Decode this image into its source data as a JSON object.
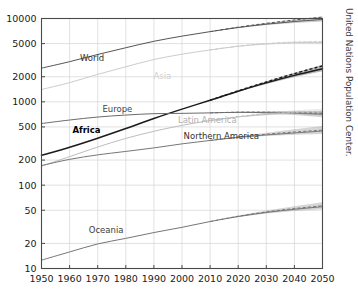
{
  "credit": {
    "text": "United Nations Population Center.",
    "orientation": "vertical-right"
  },
  "chart_data": {
    "type": "line",
    "title": "",
    "xlabel": "",
    "ylabel": "",
    "yscale": "log",
    "ylim": [
      10,
      10000
    ],
    "xlim": [
      1950,
      2050
    ],
    "grid": true,
    "legend": "inline-labels",
    "ytick_labels": [
      "10000",
      "5000",
      "2000",
      "1000",
      "500",
      "200",
      "100",
      "50",
      "20",
      "10"
    ],
    "ytick_values": [
      10000,
      5000,
      2000,
      1000,
      500,
      200,
      100,
      50,
      20,
      10
    ],
    "xtick_labels": [
      "1950",
      "1960",
      "1970",
      "1980",
      "1990",
      "2000",
      "2010",
      "2020",
      "2030",
      "2040",
      "2050"
    ],
    "xtick_values": [
      1950,
      1960,
      1970,
      1980,
      1990,
      2000,
      2010,
      2020,
      2030,
      2040,
      2050
    ],
    "units": "millions of people",
    "projection_start": 2010,
    "series": [
      {
        "name": "World",
        "label": "World",
        "color": "#555555",
        "label_color": "#333333",
        "label_x": 1968,
        "label_y": 3050,
        "bold": false,
        "x": [
          1950,
          1960,
          1970,
          1980,
          1990,
          2000,
          2010,
          2020,
          2030,
          2040,
          2050
        ],
        "values": [
          2536,
          3034,
          3700,
          4458,
          5327,
          6143,
          6957,
          7795,
          8548,
          9199,
          9735
        ],
        "projection_x": [
          2010,
          2020,
          2030,
          2040,
          2050
        ],
        "projection_values": [
          6957,
          7875,
          8750,
          9600,
          10400
        ],
        "band_low": [
          6957,
          7700,
          8350,
          8850,
          9200
        ],
        "band_high": [
          6957,
          7900,
          8850,
          9750,
          10600
        ]
      },
      {
        "name": "Asia",
        "label": "Asia",
        "color": "#cccccc",
        "label_color": "#d0d0d0",
        "label_x": 1993,
        "label_y": 1880,
        "bold": false,
        "x": [
          1950,
          1960,
          1970,
          1980,
          1990,
          2000,
          2010,
          2020,
          2030,
          2040,
          2050
        ],
        "values": [
          1405,
          1700,
          2135,
          2636,
          3221,
          3730,
          4194,
          4641,
          4947,
          5120,
          5160
        ],
        "projection_x": [
          2010,
          2020,
          2030,
          2040,
          2050
        ],
        "projection_values": [
          4194,
          4660,
          5000,
          5200,
          5270
        ],
        "band_low": [
          4194,
          4600,
          4860,
          4980,
          4900
        ],
        "band_high": [
          4194,
          4700,
          5080,
          5330,
          5420
        ]
      },
      {
        "name": "Africa",
        "label": "Africa",
        "color": "#1a1a1a",
        "label_color": "#000000",
        "label_x": 1966,
        "label_y": 420,
        "bold": true,
        "x": [
          1950,
          1960,
          1970,
          1980,
          1990,
          2000,
          2010,
          2020,
          2030,
          2040,
          2050
        ],
        "values": [
          228,
          285,
          366,
          478,
          632,
          818,
          1044,
          1341,
          1688,
          2077,
          2489
        ],
        "projection_x": [
          2010,
          2020,
          2030,
          2040,
          2050
        ],
        "projection_values": [
          1044,
          1355,
          1730,
          2180,
          2700
        ],
        "band_low": [
          1044,
          1320,
          1640,
          1990,
          2330
        ],
        "band_high": [
          1044,
          1370,
          1760,
          2240,
          2790
        ]
      },
      {
        "name": "Europe",
        "label": "Europe",
        "color": "#6b6b6b",
        "label_color": "#444444",
        "label_x": 1977,
        "label_y": 760,
        "bold": false,
        "x": [
          1950,
          1960,
          1970,
          1980,
          1990,
          2000,
          2010,
          2020,
          2030,
          2040,
          2050
        ],
        "values": [
          549,
          605,
          657,
          694,
          721,
          727,
          737,
          748,
          741,
          728,
          710
        ],
        "projection_x": [
          2010,
          2020,
          2030,
          2040,
          2050
        ],
        "projection_values": [
          737,
          752,
          752,
          742,
          728
        ],
        "band_low": [
          737,
          742,
          725,
          695,
          655
        ],
        "band_high": [
          737,
          758,
          772,
          778,
          775
        ]
      },
      {
        "name": "Latin America",
        "label": "Latin America",
        "color": "#bdbdbd",
        "label_color": "#b0b0b0",
        "label_x": 2009,
        "label_y": 560,
        "bold": false,
        "x": [
          1950,
          1960,
          1970,
          1980,
          1990,
          2000,
          2010,
          2020,
          2030,
          2040,
          2050
        ],
        "values": [
          169,
          220,
          287,
          364,
          443,
          522,
          596,
          659,
          706,
          734,
          746
        ],
        "projection_x": [
          2010,
          2020,
          2030,
          2040,
          2050
        ],
        "projection_values": [
          596,
          665,
          718,
          752,
          770
        ],
        "band_low": [
          596,
          652,
          688,
          706,
          700
        ],
        "band_high": [
          596,
          672,
          738,
          790,
          828
        ]
      },
      {
        "name": "Northern America",
        "label": "Northern America",
        "color": "#777777",
        "label_color": "#333333",
        "label_x": 2014,
        "label_y": 360,
        "bold": false,
        "x": [
          1950,
          1960,
          1970,
          1980,
          1990,
          2000,
          2010,
          2020,
          2030,
          2040,
          2050
        ],
        "values": [
          172,
          204,
          231,
          254,
          280,
          313,
          344,
          375,
          401,
          423,
          446
        ],
        "projection_x": [
          2010,
          2020,
          2030,
          2040,
          2050
        ],
        "projection_values": [
          344,
          378,
          408,
          434,
          458
        ],
        "band_low": [
          344,
          370,
          390,
          402,
          410
        ],
        "band_high": [
          344,
          385,
          425,
          468,
          512
        ]
      },
      {
        "name": "Oceania",
        "label": "Oceania",
        "color": "#767676",
        "label_color": "#3a3a3a",
        "label_x": 1973,
        "label_y": 27,
        "bold": false,
        "x": [
          1950,
          1960,
          1970,
          1980,
          1990,
          2000,
          2010,
          2020,
          2030,
          2040,
          2050
        ],
        "values": [
          12.6,
          15.8,
          19.7,
          23.0,
          27.0,
          31.2,
          36.6,
          42.0,
          47.0,
          51.3,
          55.2
        ],
        "projection_x": [
          2010,
          2020,
          2030,
          2040,
          2050
        ],
        "projection_values": [
          36.6,
          42.4,
          47.7,
          52.4,
          56.6
        ],
        "band_low": [
          36.6,
          41.6,
          45.8,
          49.0,
          51.3
        ],
        "band_high": [
          36.6,
          43.2,
          49.6,
          56.0,
          62.4
        ]
      }
    ]
  }
}
